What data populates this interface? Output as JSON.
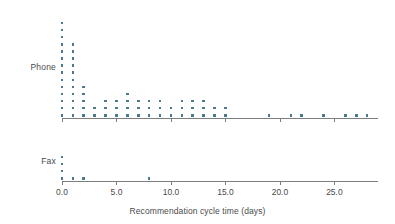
{
  "chart_data": {
    "type": "scatter",
    "subtype": "dotplot",
    "title": "",
    "xlabel": "Recommendation cycle time (days)",
    "ylabel": "",
    "xlim": [
      -0.6,
      29.0
    ],
    "xticks": [
      0,
      5,
      10,
      15,
      20,
      25
    ],
    "xticklabels": [
      "0.0",
      "5.0",
      "10.0",
      "15.0",
      "20.0",
      "25.0"
    ],
    "grid": false,
    "legend": null,
    "dot_color": "#4a7a8c",
    "axis_color": "#7d7d7d",
    "panels": [
      {
        "label": "Phone",
        "x": [
          0,
          1,
          2,
          3,
          4,
          5,
          6,
          7,
          8,
          9,
          10,
          11,
          12,
          13,
          14,
          15,
          19,
          21,
          22,
          24,
          26,
          27,
          28
        ],
        "counts": [
          14,
          11,
          5,
          2,
          3,
          3,
          4,
          3,
          3,
          3,
          2,
          3,
          3,
          3,
          2,
          2,
          1,
          1,
          1,
          1,
          1,
          1,
          1
        ]
      },
      {
        "label": "Fax",
        "x": [
          0,
          1,
          2,
          8
        ],
        "counts": [
          4,
          1,
          1,
          1
        ]
      }
    ]
  },
  "figure": {
    "xaxis_label": "Recommendation cycle time (days)",
    "panel_phone_label": "Phone",
    "panel_fax_label": "Fax"
  }
}
